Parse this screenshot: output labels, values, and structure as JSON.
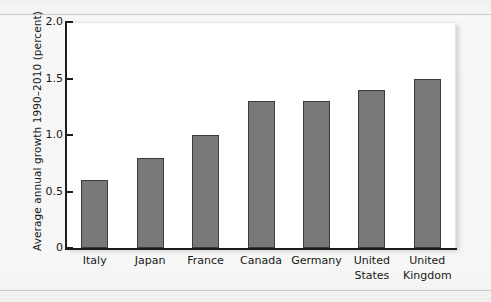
{
  "chart_data": {
    "type": "bar",
    "title": "",
    "subtitle": "",
    "xlabel": "",
    "ylabel": "Average annual growth 1990–2010 (percent)",
    "categories": [
      "Italy",
      "Japan",
      "France",
      "Canada",
      "Germany",
      "United States",
      "United Kingdom"
    ],
    "values": [
      0.6,
      0.8,
      1.0,
      1.3,
      1.3,
      1.4,
      1.5
    ],
    "ylim": [
      0,
      2.0
    ],
    "yticks": [
      "0",
      "0.5",
      "1.0",
      "1.5",
      "2.0"
    ],
    "ytick_values": [
      0,
      0.5,
      1.0,
      1.5,
      2.0
    ],
    "grid": false,
    "legend": false,
    "bar_color": "#78797b",
    "bar_edge_color": "#3a3b3d",
    "axis_color": "#1c1c1c",
    "plot_background": "#ffffff",
    "page_background": "#f4f4f2"
  },
  "x_label_lines": [
    [
      "Italy"
    ],
    [
      "Japan"
    ],
    [
      "France"
    ],
    [
      "Canada"
    ],
    [
      "Germany"
    ],
    [
      "United",
      "States"
    ],
    [
      "United",
      "Kingdom"
    ]
  ]
}
